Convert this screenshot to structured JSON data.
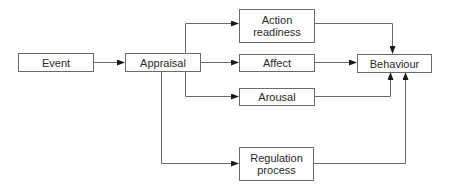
{
  "diagram": {
    "nodes": {
      "event": {
        "label": "Event"
      },
      "appraisal": {
        "label": "Appraisal"
      },
      "action_readiness": {
        "label_line1": "Action",
        "label_line2": "readiness"
      },
      "affect": {
        "label": "Affect"
      },
      "arousal": {
        "label": "Arousal"
      },
      "behaviour": {
        "label": "Behaviour"
      },
      "regulation_process": {
        "label_line1": "Regulation",
        "label_line2": "process"
      }
    },
    "edges": [
      {
        "from": "Event",
        "to": "Appraisal"
      },
      {
        "from": "Appraisal",
        "to": "Action readiness"
      },
      {
        "from": "Appraisal",
        "to": "Affect"
      },
      {
        "from": "Appraisal",
        "to": "Arousal"
      },
      {
        "from": "Appraisal",
        "to": "Regulation process"
      },
      {
        "from": "Action readiness",
        "to": "Behaviour"
      },
      {
        "from": "Affect",
        "to": "Behaviour"
      },
      {
        "from": "Arousal",
        "to": "Behaviour"
      },
      {
        "from": "Regulation process",
        "to": "Behaviour"
      }
    ],
    "colors": {
      "line": "#6b6b6b",
      "arrow": "#1a1a1a",
      "text": "#2a2a2a"
    }
  }
}
